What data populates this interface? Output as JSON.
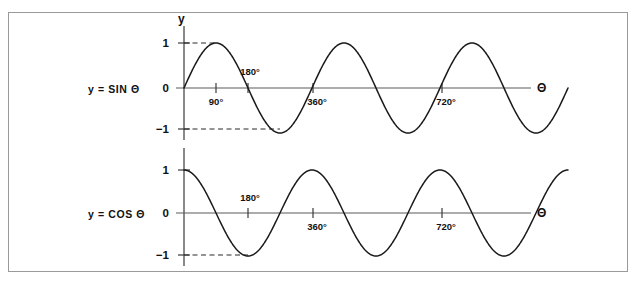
{
  "figure": {
    "background_color": "#ffffff",
    "border_color": "#9a9a9a",
    "curve_color": "#1a1a1a",
    "axis_color": "#5a5a5a"
  },
  "charts": [
    {
      "name": "sine-chart",
      "series_label": "y = SIN  Θ",
      "y_axis_name": "y",
      "x_axis_name": "Θ",
      "y_tick_labels": [
        "1",
        "0",
        "−1"
      ],
      "x_tick_labels": [
        "90°",
        "180°",
        "360°",
        "720°"
      ],
      "guides": [
        "1",
        "−1"
      ]
    },
    {
      "name": "cosine-chart",
      "series_label": "y = COS  Θ",
      "y_axis_name": "y",
      "x_axis_name": "Θ",
      "y_tick_labels": [
        "1",
        "0",
        "−1"
      ],
      "x_tick_labels": [
        "180°",
        "360°",
        "720°"
      ],
      "guides": [
        "−1"
      ]
    }
  ],
  "chart_data": [
    {
      "type": "line",
      "name": "sine",
      "title": "y = SIN Θ",
      "function": "y = sin(θ)",
      "xlabel": "Θ",
      "ylabel": "y",
      "xlim": [
        0,
        1080
      ],
      "ylim": [
        -1,
        1
      ],
      "grid": false,
      "legend": "none",
      "x_ticks": [
        90,
        180,
        360,
        720
      ],
      "x_tick_labels": [
        "90°",
        "180°",
        "360°",
        "720°"
      ],
      "y_ticks": [
        1,
        0,
        -1
      ],
      "y_tick_labels": [
        "1",
        "0",
        "−1"
      ],
      "annotations": [
        {
          "type": "dashed-guide",
          "y": 1,
          "from_x": 0,
          "to_x": 90
        },
        {
          "type": "dashed-guide",
          "y": -1,
          "from_x": 0,
          "to_x": 270
        }
      ],
      "key_points": [
        {
          "x": 0,
          "y": 0
        },
        {
          "x": 90,
          "y": 1
        },
        {
          "x": 180,
          "y": 0
        },
        {
          "x": 270,
          "y": -1
        },
        {
          "x": 360,
          "y": 0
        },
        {
          "x": 450,
          "y": 1
        },
        {
          "x": 540,
          "y": 0
        },
        {
          "x": 630,
          "y": -1
        },
        {
          "x": 720,
          "y": 0
        },
        {
          "x": 810,
          "y": 1
        },
        {
          "x": 900,
          "y": 0
        },
        {
          "x": 990,
          "y": -1
        },
        {
          "x": 1080,
          "y": 0
        }
      ]
    },
    {
      "type": "line",
      "name": "cosine",
      "title": "y = COS Θ",
      "function": "y = cos(θ)",
      "xlabel": "Θ",
      "ylabel": "y",
      "xlim": [
        0,
        1080
      ],
      "ylim": [
        -1,
        1
      ],
      "grid": false,
      "legend": "none",
      "x_ticks": [
        180,
        360,
        720
      ],
      "x_tick_labels": [
        "180°",
        "360°",
        "720°"
      ],
      "y_ticks": [
        1,
        0,
        -1
      ],
      "y_tick_labels": [
        "1",
        "0",
        "−1"
      ],
      "annotations": [
        {
          "type": "dashed-guide",
          "y": -1,
          "from_x": 0,
          "to_x": 180
        }
      ],
      "key_points": [
        {
          "x": 0,
          "y": 1
        },
        {
          "x": 90,
          "y": 0
        },
        {
          "x": 180,
          "y": -1
        },
        {
          "x": 270,
          "y": 0
        },
        {
          "x": 360,
          "y": 1
        },
        {
          "x": 450,
          "y": 0
        },
        {
          "x": 540,
          "y": -1
        },
        {
          "x": 630,
          "y": 0
        },
        {
          "x": 720,
          "y": 1
        },
        {
          "x": 810,
          "y": 0
        },
        {
          "x": 900,
          "y": -1
        },
        {
          "x": 990,
          "y": 0
        },
        {
          "x": 1080,
          "y": 1
        }
      ]
    }
  ]
}
